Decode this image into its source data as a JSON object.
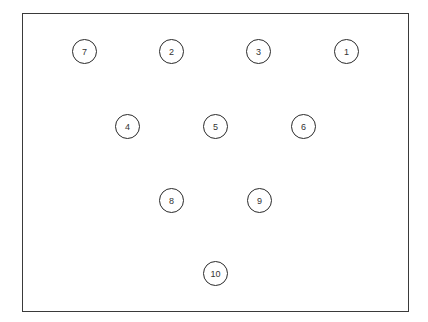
{
  "diagram": {
    "frame": {
      "x": 22,
      "y": 13,
      "width": 387,
      "height": 299
    },
    "nodes": [
      {
        "label": "7",
        "cx": 85,
        "cy": 52
      },
      {
        "label": "2",
        "cx": 172,
        "cy": 52
      },
      {
        "label": "3",
        "cx": 259,
        "cy": 52
      },
      {
        "label": "1",
        "cx": 347,
        "cy": 52
      },
      {
        "label": "4",
        "cx": 128,
        "cy": 127
      },
      {
        "label": "5",
        "cx": 216,
        "cy": 127
      },
      {
        "label": "6",
        "cx": 304,
        "cy": 127
      },
      {
        "label": "8",
        "cx": 172,
        "cy": 201
      },
      {
        "label": "9",
        "cx": 260,
        "cy": 201
      },
      {
        "label": "10",
        "cx": 216,
        "cy": 274
      }
    ]
  }
}
